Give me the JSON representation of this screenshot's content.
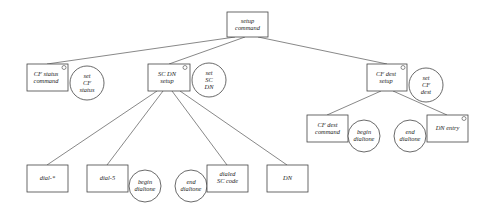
{
  "diagram": {
    "type": "tree",
    "nodes": {
      "setup_command": {
        "lines": [
          "setup",
          "command"
        ],
        "shape": "box",
        "marker": false
      },
      "cf_status_command": {
        "lines": [
          "CF status",
          "command"
        ],
        "shape": "box",
        "marker": true
      },
      "set_cf_status": {
        "lines": [
          "set",
          "CF",
          "status"
        ],
        "shape": "circle"
      },
      "sc_dn_setup": {
        "lines": [
          "SC DN",
          "setup"
        ],
        "shape": "box",
        "marker": true
      },
      "set_sc_dn": {
        "lines": [
          "set",
          "SC",
          "DN"
        ],
        "shape": "circle"
      },
      "cf_dest_setup": {
        "lines": [
          "CF dest",
          "setup"
        ],
        "shape": "box",
        "marker": true
      },
      "set_cf_dest": {
        "lines": [
          "set",
          "CF",
          "dest"
        ],
        "shape": "circle"
      },
      "cf_dest_command": {
        "lines": [
          "CF dest",
          "command"
        ],
        "shape": "box",
        "marker": false
      },
      "begin_dialtone_1": {
        "lines": [
          "begin",
          "dialtone"
        ],
        "shape": "circle"
      },
      "end_dialtone_1": {
        "lines": [
          "end",
          "dialtone"
        ],
        "shape": "circle"
      },
      "dn_entry": {
        "lines": [
          "DN entry"
        ],
        "shape": "box",
        "marker": true
      },
      "dial_star": {
        "lines": [
          "dial-*"
        ],
        "shape": "box",
        "marker": false
      },
      "dial_5": {
        "lines": [
          "dial-5"
        ],
        "shape": "box",
        "marker": false
      },
      "begin_dialtone_2": {
        "lines": [
          "begin",
          "dialtone"
        ],
        "shape": "circle"
      },
      "end_dialtone_2": {
        "lines": [
          "end",
          "dialtone"
        ],
        "shape": "circle"
      },
      "dialed_sc_code": {
        "lines": [
          "dialed",
          "SC code"
        ],
        "shape": "box",
        "marker": false
      },
      "dn": {
        "lines": [
          "DN"
        ],
        "shape": "box",
        "marker": false
      }
    },
    "edges": [
      [
        "setup_command",
        "cf_status_command"
      ],
      [
        "setup_command",
        "sc_dn_setup"
      ],
      [
        "setup_command",
        "cf_dest_setup"
      ],
      [
        "sc_dn_setup",
        "dial_star"
      ],
      [
        "sc_dn_setup",
        "dial_5"
      ],
      [
        "sc_dn_setup",
        "dialed_sc_code"
      ],
      [
        "sc_dn_setup",
        "dn"
      ],
      [
        "cf_dest_setup",
        "cf_dest_command"
      ],
      [
        "cf_dest_setup",
        "dn_entry"
      ]
    ]
  }
}
